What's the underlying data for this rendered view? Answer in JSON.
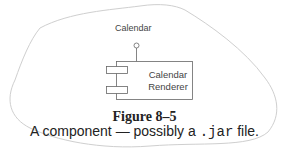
{
  "diagram": {
    "interface_label": "Calendar",
    "component_name_line1": "Calendar",
    "component_name_line2": "Renderer"
  },
  "figure": {
    "title": "Figure 8–5",
    "caption_pre": "A component — possibly a ",
    "caption_code": ".jar",
    "caption_post": " file."
  },
  "colors": {
    "outline": "#c8c8c8",
    "component_stroke": "#666666",
    "text": "#222222"
  }
}
